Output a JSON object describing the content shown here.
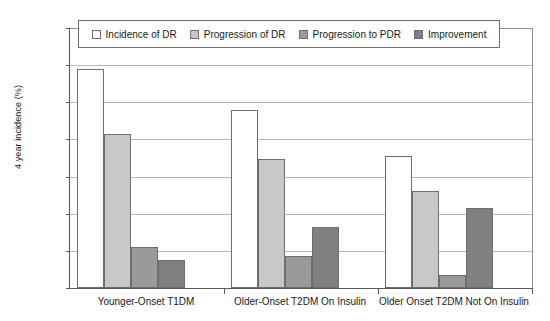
{
  "chart_data": {
    "type": "bar",
    "title": "",
    "xlabel": "",
    "ylabel": "4 year incidence (%)",
    "ylim": [
      0,
      70
    ],
    "ytick_step": 10,
    "yticks": [
      0,
      10,
      20,
      30,
      40,
      50,
      60,
      70
    ],
    "grid": true,
    "legend_position": "top-inside",
    "categories": [
      "Younger-Onset T1DM",
      "Older-Onset T2DM On Insulin",
      "Older Onset T2DM Not On Insulin"
    ],
    "series": [
      {
        "name": "Incidence of DR",
        "color": "#ffffff",
        "values": [
          59.0,
          48.0,
          35.5
        ]
      },
      {
        "name": "Progression of DR",
        "color": "#c8c8c8",
        "values": [
          41.5,
          34.8,
          26.0
        ]
      },
      {
        "name": "Progression to PDR",
        "color": "#9a9a9a",
        "values": [
          11.0,
          8.5,
          3.5
        ]
      },
      {
        "name": "Improvement",
        "color": "#808080",
        "values": [
          7.5,
          16.3,
          21.5
        ]
      }
    ]
  },
  "colors": {
    "axis": "#5a5a5a",
    "grid": "#b8b8b8",
    "bar_border": "#6e6e6e",
    "text": "#1a1a1a",
    "background": "#ffffff"
  }
}
